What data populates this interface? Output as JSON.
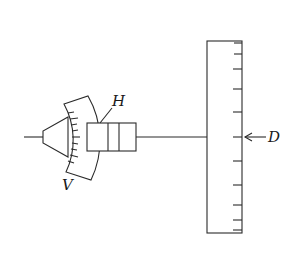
{
  "diagram": {
    "labels": {
      "H": "H",
      "V": "V",
      "D": "D"
    },
    "colors": {
      "stroke": "#2a2a2a",
      "background": "#ffffff"
    },
    "scale": {
      "tick_positions_y": [
        43,
        54,
        69,
        89,
        112,
        137,
        161,
        185,
        205,
        220,
        230
      ]
    }
  }
}
